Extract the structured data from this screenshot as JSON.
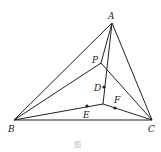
{
  "diagram": {
    "type": "geometry",
    "points": {
      "A": {
        "label": "A",
        "x": 112,
        "y": 23
      },
      "B": {
        "label": "B",
        "x": 14,
        "y": 120
      },
      "C": {
        "label": "C",
        "x": 152,
        "y": 120
      },
      "P": {
        "label": "P",
        "x": 101,
        "y": 63
      },
      "D": {
        "label": "D",
        "x": 104,
        "y": 87
      },
      "O": {
        "label": "",
        "x": 103,
        "y": 104
      },
      "E": {
        "label": "E",
        "x": 87,
        "y": 106
      },
      "F": {
        "label": "F",
        "x": 115,
        "y": 108
      }
    },
    "segments": [
      [
        "A",
        "B"
      ],
      [
        "A",
        "C"
      ],
      [
        "B",
        "C"
      ],
      [
        "A",
        "P"
      ],
      [
        "B",
        "P"
      ],
      [
        "P",
        "C"
      ],
      [
        "A",
        "O"
      ],
      [
        "B",
        "O"
      ],
      [
        "O",
        "C"
      ]
    ],
    "dots": [
      "D",
      "E",
      "F"
    ],
    "caption": "图"
  }
}
